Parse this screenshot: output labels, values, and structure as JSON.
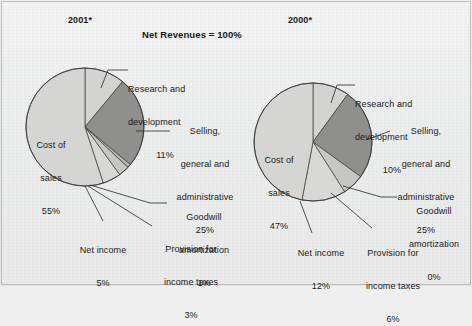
{
  "figure": {
    "title": "Net Revenues = 100%",
    "background_color": "#eeefee",
    "has_border": true
  },
  "charts": [
    {
      "year_label": "2001*",
      "year_x": 68,
      "year_y": 18,
      "cx": 85,
      "cy": 127,
      "r": 59
    },
    {
      "year_label": "2000*",
      "year_x": 288,
      "year_y": 18,
      "cx": 313,
      "cy": 142,
      "r": 59
    }
  ],
  "labels_2001": {
    "research": {
      "line1": "Research and",
      "line2": "development",
      "value": "11%"
    },
    "selling": {
      "line1": "Selling,",
      "line2": "general and",
      "line3": "administrative",
      "value": "25%"
    },
    "goodwill": {
      "line1": "Goodwill",
      "line2": "amortization",
      "value": "1%"
    },
    "provision": {
      "line1": "Provision for",
      "line2": "income taxes",
      "value": "3%"
    },
    "netincome": {
      "line1": "Net income",
      "value": "5%"
    },
    "costofsales": {
      "line1": "Cost of",
      "line2": "sales",
      "value": "55%"
    }
  },
  "labels_2000": {
    "research": {
      "line1": "Research and",
      "line2": "development",
      "value": "10%"
    },
    "selling": {
      "line1": "Selling,",
      "line2": "general and",
      "line3": "administrative",
      "value": "25%"
    },
    "goodwill": {
      "line1": "Goodwill",
      "line2": "amortization",
      "value": "0%"
    },
    "provision": {
      "line1": "Provision for",
      "line2": "income taxes",
      "value": "6%"
    },
    "netincome": {
      "line1": "Net income",
      "value": "12%"
    },
    "costofsales": {
      "line1": "Cost of",
      "line2": "sales",
      "value": "47%"
    }
  },
  "chart_data": [
    {
      "type": "pie",
      "title": "2001*",
      "subtitle": "Net Revenues = 100%",
      "labels": [
        "Research and development",
        "Selling, general and administrative",
        "Goodwill amortization",
        "Provision for income taxes",
        "Net income",
        "Cost of sales"
      ],
      "values": [
        11,
        25,
        1,
        3,
        5,
        55
      ],
      "value_labels": [
        "11%",
        "25%",
        "1%",
        "3%",
        "5%",
        "55%"
      ],
      "colors": [
        "#d3d3d1",
        "#8f8f8d",
        "#b6b6b4",
        "#c6c6c4",
        "#d8d8d6",
        "#d5d5d3"
      ],
      "start_angle_deg": 0,
      "direction": "clockwise",
      "units": "percent",
      "legend": "external-callouts"
    },
    {
      "type": "pie",
      "title": "2000*",
      "subtitle": "Net Revenues = 100%",
      "labels": [
        "Research and development",
        "Selling, general and administrative",
        "Goodwill amortization",
        "Provision for income taxes",
        "Net income",
        "Cost of sales"
      ],
      "values": [
        10,
        25,
        0,
        6,
        12,
        47
      ],
      "value_labels": [
        "10%",
        "25%",
        "0%",
        "6%",
        "12%",
        "47%"
      ],
      "colors": [
        "#d3d3d1",
        "#8f8f8d",
        "#b6b6b4",
        "#c6c6c4",
        "#d8d8d6",
        "#d5d5d3"
      ],
      "start_angle_deg": 0,
      "direction": "clockwise",
      "units": "percent",
      "legend": "external-callouts"
    }
  ]
}
